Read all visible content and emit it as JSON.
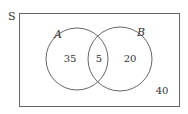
{
  "diagram": {
    "type": "venn",
    "universe_label": "S",
    "sets": [
      {
        "label": "A",
        "only_count": "35"
      },
      {
        "label": "B",
        "only_count": "20"
      }
    ],
    "intersection_count": "5",
    "outside_count": "40"
  },
  "colors": {
    "stroke": "#555555",
    "text": "#333333",
    "background": "#ffffff"
  }
}
